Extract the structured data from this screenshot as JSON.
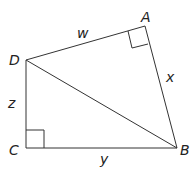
{
  "diagram": {
    "type": "quadrilateral-with-diagonal",
    "vertices": {
      "A": {
        "label": "A",
        "x": 145,
        "y": 26
      },
      "B": {
        "label": "B",
        "x": 177,
        "y": 148
      },
      "C": {
        "label": "C",
        "x": 26,
        "y": 148
      },
      "D": {
        "label": "D",
        "x": 26,
        "y": 60
      }
    },
    "sides": {
      "DA": {
        "label": "w"
      },
      "AB": {
        "label": "x"
      },
      "CB": {
        "label": "y"
      },
      "DC": {
        "label": "z"
      }
    },
    "diagonal": "DB",
    "right_angles": [
      "A",
      "C"
    ]
  }
}
